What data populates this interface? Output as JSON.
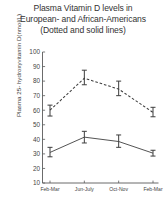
{
  "chart_data": {
    "type": "line",
    "title": "Plasma Vitamin D levels in European- and African-Americans (Dotted and solid lines)",
    "title_lines": [
      "Plasma Vitamin D levels in",
      "European- and African-Americans",
      "(Dotted and solid lines)"
    ],
    "xlabel": "",
    "ylabel": "Plasma 25- hydroxyvitamin D(nmol/L)",
    "categories": [
      "Feb-Mar",
      "Jun-July",
      "Oct-Nov",
      "Feb-Mar"
    ],
    "ylim": [
      10,
      100
    ],
    "yticks": [
      10,
      20,
      30,
      40,
      50,
      60,
      70,
      80,
      90,
      100
    ],
    "grid": false,
    "legend": "none",
    "legend_note": "Dotted line = European-Americans; solid line = African-Americans",
    "series": [
      {
        "name": "European-Americans",
        "style": "dotted",
        "values": [
          60,
          82,
          74.5,
          58.5
        ],
        "error_low": [
          56,
          77.5,
          70,
          55.5
        ],
        "error_high": [
          63.5,
          87.5,
          80,
          62
        ]
      },
      {
        "name": "African-Americans",
        "style": "solid",
        "values": [
          31,
          41.5,
          38.5,
          30.5
        ],
        "error_low": [
          28,
          37.5,
          34.5,
          28.5
        ],
        "error_high": [
          34.5,
          45.5,
          43,
          32.5
        ]
      }
    ]
  }
}
